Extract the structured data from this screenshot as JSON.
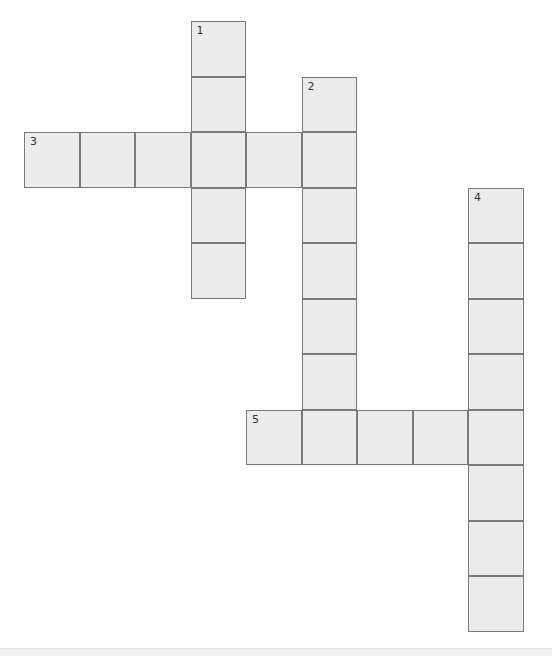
{
  "puzzle": {
    "type": "crossword",
    "colors": {
      "cell_fill": "#ececec",
      "cell_border": "#7a7a7a",
      "background": "#ffffff"
    },
    "entries": [
      {
        "number": "1",
        "direction": "down",
        "start_row": 0,
        "start_col": 3,
        "length": 5
      },
      {
        "number": "2",
        "direction": "down",
        "start_row": 1,
        "start_col": 5,
        "length": 7
      },
      {
        "number": "3",
        "direction": "across",
        "start_row": 2,
        "start_col": 0,
        "length": 6
      },
      {
        "number": "4",
        "direction": "down",
        "start_row": 3,
        "start_col": 8,
        "length": 8
      },
      {
        "number": "5",
        "direction": "across",
        "start_row": 7,
        "start_col": 4,
        "length": 5
      }
    ]
  }
}
